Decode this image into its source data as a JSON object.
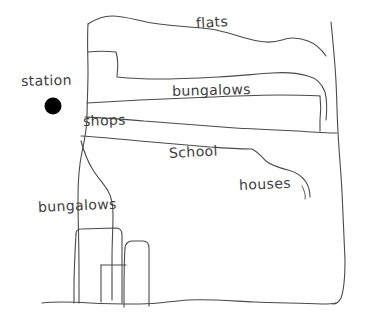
{
  "map": {
    "title": "Neighbourhood sketch map",
    "background_color": "#ffffff",
    "ink_color": "#4a4a4a",
    "marker_color": "#000000",
    "labels": [
      {
        "id": "flats",
        "text": "flats",
        "x": 196,
        "y": 16,
        "rotation": -3.5
      },
      {
        "id": "station",
        "text": "station",
        "x": 21,
        "y": 74,
        "rotation": -1.5
      },
      {
        "id": "bungalows_north",
        "text": "bungalows",
        "x": 172,
        "y": 84,
        "rotation": -1.5
      },
      {
        "id": "shops",
        "text": "shops",
        "x": 83,
        "y": 114,
        "rotation": -2
      },
      {
        "id": "school",
        "text": "School",
        "x": 169,
        "y": 146,
        "rotation": -3
      },
      {
        "id": "houses",
        "text": "houses",
        "x": 239,
        "y": 178,
        "rotation": -2.5
      },
      {
        "id": "bungalows_south",
        "text": "bungalows",
        "x": 38,
        "y": 200,
        "rotation": -2.5
      }
    ],
    "station_marker": {
      "cx": 53,
      "cy": 106,
      "r": 8.5
    },
    "zones": [
      "flats",
      "bungalows",
      "shops",
      "School",
      "houses",
      "bungalows"
    ]
  }
}
